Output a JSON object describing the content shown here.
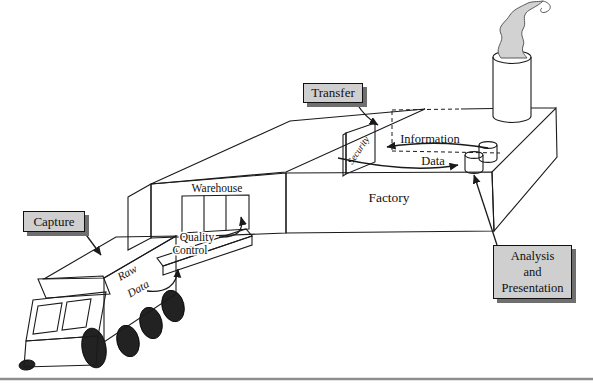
{
  "diagram": {
    "title_semantic": "data-warehouse-factory-metaphor",
    "labels": {
      "capture": "Capture",
      "transfer": "Transfer",
      "warehouse": "Warehouse",
      "quality_line1": "Quality",
      "quality_line2": "Control",
      "raw_line1": "Raw",
      "raw_line2": "Data",
      "security": "Security",
      "information": "Information",
      "data": "Data",
      "factory": "Factory",
      "analysis_line1": "Analysis",
      "analysis_line2": "and",
      "analysis_line3": "Presentation"
    },
    "colors": {
      "background": "#ffffff",
      "line": "#1a1a1a",
      "label_box_fill": "#cfcfcf",
      "label_box_shadow": "#6f6f6f",
      "roof_gray": "#d4d4d4",
      "factory_side_gray": "#c2c2c2",
      "ramp_top_gray": "#c6c6c6",
      "ramp_side_gray": "#e9e9e9",
      "chimney_gray": "#b5b5b5",
      "chimney_top_gray": "#8a8a8a",
      "smoke_gray": "#d2d2d2",
      "cylinder_gray": "#c8c8c8",
      "cylinder_top_gray": "#dcdcdc",
      "truck_light_gray": "#e2e2e2",
      "windshield_gray": "#d8d8d8",
      "wheel_black": "#222222",
      "rule_gray": "#8e8e8e"
    }
  }
}
